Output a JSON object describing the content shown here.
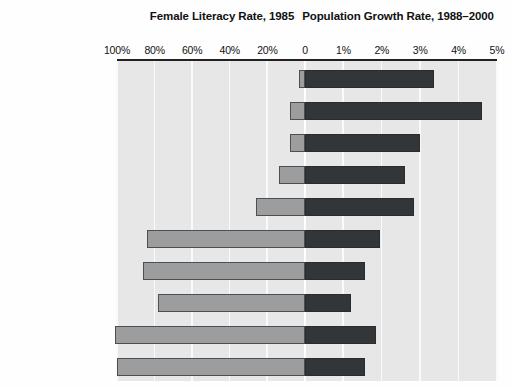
{
  "headers": {
    "left_title": "Female Literacy Rate, 1985",
    "right_title": "Population Growth Rate, 1988–2000"
  },
  "colors": {
    "literacy_bar": "#9b9d9e",
    "growth_bar": "#333638",
    "plot_background": "#e7e7e7",
    "gridline": "#fafafa",
    "axis": "#222222"
  },
  "ticks": [
    {
      "label": "100%",
      "value": 100,
      "side": "left"
    },
    {
      "label": "80%",
      "value": 80,
      "side": "left"
    },
    {
      "label": "60%",
      "value": 60,
      "side": "left"
    },
    {
      "label": "40%",
      "value": 40,
      "side": "left"
    },
    {
      "label": "20%",
      "value": 20,
      "side": "left"
    },
    {
      "label": "0",
      "value": 0,
      "side": "center"
    },
    {
      "label": "1%",
      "value": 1,
      "side": "right"
    },
    {
      "label": "2%",
      "value": 2,
      "side": "right"
    },
    {
      "label": "3%",
      "value": 3,
      "side": "right"
    },
    {
      "label": "4%",
      "value": 4,
      "side": "right"
    },
    {
      "label": "5%",
      "value": 5,
      "side": "right"
    }
  ],
  "chart_data": {
    "type": "bar",
    "orientation": "horizontal",
    "layout": "diverging-bidirectional",
    "grid": true,
    "legend": "none",
    "categories": [
      "Yemen Arab Rep.",
      "Afghanistan",
      "Mali",
      "Sudan",
      "Pakistan",
      "Dominican Rep.",
      "Jamaica",
      "Sri Lanka",
      "Colombia",
      "Thailand"
    ],
    "series": [
      {
        "name": "Female Literacy Rate, 1985",
        "unit": "%",
        "axis": "left",
        "direction": "leftward",
        "xlabel": "Female Literacy Rate, 1985",
        "xlim": [
          100,
          0
        ],
        "tick_labels": [
          "100%",
          "80%",
          "60%",
          "40%",
          "20%",
          "0"
        ],
        "values": [
          3,
          8,
          8,
          14,
          26,
          84,
          86,
          78,
          101,
          100
        ]
      },
      {
        "name": "Population Growth Rate, 1988–2000",
        "unit": "%",
        "axis": "right",
        "direction": "rightward",
        "xlabel": "Population Growth Rate, 1988–2000",
        "xlim": [
          0,
          5
        ],
        "tick_labels": [
          "0",
          "1%",
          "2%",
          "3%",
          "4%",
          "5%"
        ],
        "values": [
          3.35,
          4.6,
          3.0,
          2.6,
          2.85,
          1.95,
          1.55,
          1.2,
          1.85,
          1.55
        ]
      }
    ]
  }
}
